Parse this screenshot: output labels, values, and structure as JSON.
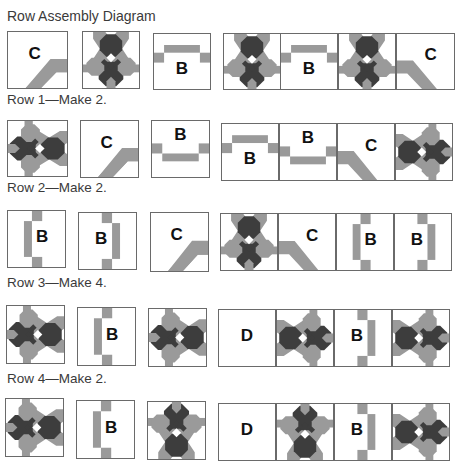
{
  "title": "Row Assembly Diagram",
  "colors": {
    "light": "#9a9a9a",
    "dark": "#3d3d3d",
    "border": "#6a6a6a"
  },
  "rows": [
    {
      "label": "Row 1—Make 2.",
      "label_top": 92,
      "blocks": [
        {
          "type": "C",
          "variant": "c-br",
          "x": 7,
          "y": 31,
          "w": 61,
          "h": 58
        },
        {
          "type": "flower",
          "variant": "flower-down",
          "x": 82,
          "y": 31,
          "w": 58,
          "h": 58
        },
        {
          "type": "B",
          "variant": "b-top",
          "x": 153,
          "y": 33,
          "w": 58,
          "h": 57
        },
        {
          "type": "flower",
          "variant": "flower-down",
          "x": 223,
          "y": 33,
          "w": 58,
          "h": 57
        },
        {
          "type": "B",
          "variant": "b-top",
          "x": 280,
          "y": 33,
          "w": 58,
          "h": 57
        },
        {
          "type": "flower",
          "variant": "flower-down",
          "x": 338,
          "y": 33,
          "w": 58,
          "h": 57
        },
        {
          "type": "C",
          "variant": "c-bl",
          "x": 396,
          "y": 33,
          "w": 59,
          "h": 57
        }
      ]
    },
    {
      "label": "Row 2—Make 2.",
      "label_top": 180,
      "blocks": [
        {
          "type": "flower",
          "variant": "flower-left",
          "x": 7,
          "y": 120,
          "w": 61,
          "h": 57
        },
        {
          "type": "C",
          "variant": "c-br",
          "x": 80,
          "y": 120,
          "w": 59,
          "h": 58
        },
        {
          "type": "B",
          "variant": "b-bottom",
          "x": 151,
          "y": 120,
          "w": 59,
          "h": 58
        },
        {
          "type": "B",
          "variant": "b-top",
          "x": 221,
          "y": 123,
          "w": 58,
          "h": 58
        },
        {
          "type": "B",
          "variant": "b-bottom",
          "x": 279,
          "y": 123,
          "w": 58,
          "h": 58
        },
        {
          "type": "C",
          "variant": "c-bl",
          "x": 337,
          "y": 123,
          "w": 58,
          "h": 58
        },
        {
          "type": "flower",
          "variant": "flower-right",
          "x": 395,
          "y": 123,
          "w": 58,
          "h": 58
        }
      ]
    },
    {
      "label": "Row 3—Make 4.",
      "label_top": 275,
      "blocks": [
        {
          "type": "B",
          "variant": "b-left",
          "x": 7,
          "y": 210,
          "w": 59,
          "h": 58
        },
        {
          "type": "B",
          "variant": "b-right",
          "x": 78,
          "y": 212,
          "w": 59,
          "h": 58
        },
        {
          "type": "C",
          "variant": "c-br",
          "x": 150,
          "y": 212,
          "w": 59,
          "h": 60
        },
        {
          "type": "flower",
          "variant": "flower-down",
          "x": 220,
          "y": 213,
          "w": 58,
          "h": 58
        },
        {
          "type": "C",
          "variant": "c-bl",
          "x": 278,
          "y": 213,
          "w": 58,
          "h": 58
        },
        {
          "type": "B",
          "variant": "b-left",
          "x": 336,
          "y": 213,
          "w": 58,
          "h": 58
        },
        {
          "type": "B",
          "variant": "b-right",
          "x": 394,
          "y": 213,
          "w": 58,
          "h": 58
        }
      ]
    },
    {
      "label": "Row 4—Make 2.",
      "label_top": 371,
      "blocks": [
        {
          "type": "flower",
          "variant": "flower-left",
          "x": 6,
          "y": 305,
          "w": 59,
          "h": 59
        },
        {
          "type": "B",
          "variant": "b-left",
          "x": 77,
          "y": 307,
          "w": 59,
          "h": 59
        },
        {
          "type": "flower",
          "variant": "flower-left",
          "x": 148,
          "y": 308,
          "w": 59,
          "h": 59
        },
        {
          "type": "D",
          "variant": "d",
          "x": 218,
          "y": 309,
          "w": 58,
          "h": 58
        },
        {
          "type": "flower",
          "variant": "flower-right",
          "x": 276,
          "y": 309,
          "w": 58,
          "h": 58
        },
        {
          "type": "B",
          "variant": "b-right",
          "x": 334,
          "y": 309,
          "w": 58,
          "h": 58
        },
        {
          "type": "flower",
          "variant": "flower-right",
          "x": 392,
          "y": 309,
          "w": 58,
          "h": 58
        }
      ]
    },
    {
      "label": "",
      "label_top": 0,
      "blocks": [
        {
          "type": "flower",
          "variant": "flower-left",
          "x": 5,
          "y": 398,
          "w": 59,
          "h": 59
        },
        {
          "type": "B",
          "variant": "b-left",
          "x": 76,
          "y": 400,
          "w": 59,
          "h": 59
        },
        {
          "type": "flower",
          "variant": "flower-up",
          "x": 147,
          "y": 401,
          "w": 59,
          "h": 59
        },
        {
          "type": "D",
          "variant": "d",
          "x": 218,
          "y": 403,
          "w": 58,
          "h": 58
        },
        {
          "type": "flower",
          "variant": "flower-up",
          "x": 276,
          "y": 403,
          "w": 58,
          "h": 58
        },
        {
          "type": "B",
          "variant": "b-right",
          "x": 334,
          "y": 403,
          "w": 58,
          "h": 58
        },
        {
          "type": "flower",
          "variant": "flower-right",
          "x": 392,
          "y": 403,
          "w": 58,
          "h": 58
        }
      ]
    }
  ]
}
